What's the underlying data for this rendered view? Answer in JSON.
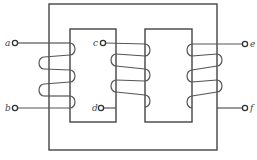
{
  "figure": {
    "type": "transformer-core-winding-diagram",
    "terminals": [
      {
        "id": "a",
        "label": "a"
      },
      {
        "id": "b",
        "label": "b"
      },
      {
        "id": "c",
        "label": "c"
      },
      {
        "id": "d",
        "label": "d"
      },
      {
        "id": "e",
        "label": "e"
      },
      {
        "id": "f",
        "label": "f"
      }
    ],
    "windings": [
      {
        "name": "winding-ab",
        "terminals": [
          "a",
          "b"
        ],
        "location": "left outer limb",
        "loops": 3
      },
      {
        "name": "winding-cd",
        "terminals": [
          "c",
          "d"
        ],
        "location": "center limb",
        "loops": 3
      },
      {
        "name": "winding-ef",
        "terminals": [
          "e",
          "f"
        ],
        "location": "right outer limb",
        "loops": 3
      }
    ],
    "caption": "",
    "colors": {
      "line": "#555555",
      "background": "#ffffff"
    }
  }
}
